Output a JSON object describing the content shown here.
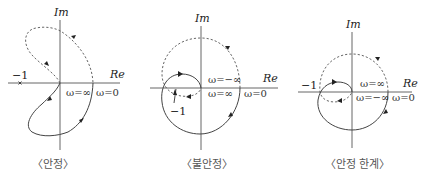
{
  "panels": [
    {
      "id": "stable",
      "axis_im": "Im",
      "axis_re": "Re",
      "critical_point": "−1",
      "omega_labels": [
        "ω=∞",
        "ω=0"
      ],
      "caption": "〈안정〉"
    },
    {
      "id": "unstable",
      "axis_im": "Im",
      "axis_re": "Re",
      "critical_point": "−1",
      "omega_labels": [
        "ω=−∞",
        "ω=∞",
        "ω=0"
      ],
      "caption": "〈불안정〉"
    },
    {
      "id": "marginal",
      "axis_im": "Im",
      "axis_re": "Re",
      "critical_point": "−1",
      "omega_labels": [
        "ω=∞",
        "ω=−∞",
        "ω=0"
      ],
      "caption": "〈안정 한계〉"
    }
  ]
}
